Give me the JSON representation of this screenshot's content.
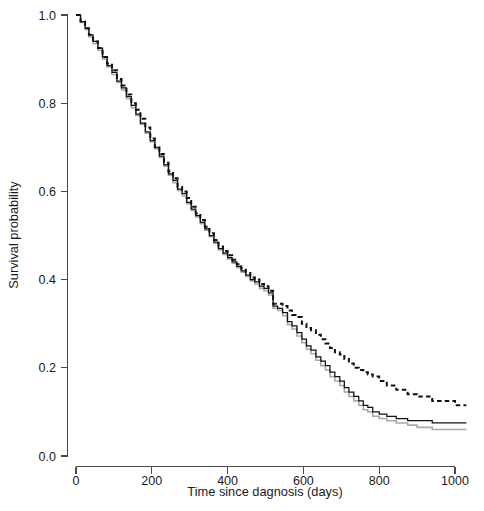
{
  "figure": {
    "name": "kaplan-meier-survival-plot",
    "background": "#ffffff"
  },
  "chart_data": {
    "type": "line",
    "title": "",
    "subtitle": "",
    "xlabel": "Time since dagnosis (days)",
    "ylabel": "Survival probability",
    "xlim": [
      0,
      1040
    ],
    "ylim": [
      0.0,
      1.0
    ],
    "grid": false,
    "legend": null,
    "legend_position": "none",
    "xticks": [
      0,
      200,
      400,
      600,
      800,
      1000
    ],
    "xticklabels": [
      "0",
      "200",
      "400",
      "600",
      "800",
      "1000"
    ],
    "yticks": [
      0.0,
      0.2,
      0.4,
      0.6,
      0.8,
      1.0
    ],
    "yticklabels": [
      "0.0",
      "0.2",
      "0.4",
      "0.6",
      "0.8",
      "1.0"
    ],
    "step_shape": "hv",
    "series": [
      {
        "name": "curve-dashed",
        "style": "dashed",
        "color": "#111111",
        "width": 2.0,
        "final_value": 0.115,
        "x": [
          0,
          12,
          24,
          34,
          45,
          58,
          70,
          82,
          95,
          108,
          120,
          133,
          146,
          158,
          170,
          183,
          196,
          208,
          220,
          232,
          244,
          256,
          268,
          280,
          292,
          304,
          316,
          328,
          340,
          352,
          364,
          376,
          388,
          400,
          412,
          424,
          436,
          448,
          460,
          472,
          484,
          496,
          508,
          520,
          532,
          545,
          558,
          570,
          583,
          596,
          608,
          620,
          633,
          646,
          658,
          670,
          683,
          696,
          708,
          720,
          733,
          746,
          758,
          770,
          783,
          800,
          820,
          845,
          875,
          900,
          940,
          1000,
          1030
        ],
        "y": [
          1.0,
          0.985,
          0.97,
          0.955,
          0.94,
          0.925,
          0.905,
          0.89,
          0.875,
          0.855,
          0.84,
          0.82,
          0.8,
          0.785,
          0.765,
          0.745,
          0.72,
          0.7,
          0.685,
          0.665,
          0.645,
          0.63,
          0.61,
          0.6,
          0.585,
          0.565,
          0.55,
          0.535,
          0.52,
          0.505,
          0.49,
          0.475,
          0.465,
          0.455,
          0.445,
          0.435,
          0.425,
          0.415,
          0.405,
          0.4,
          0.39,
          0.385,
          0.375,
          0.345,
          0.345,
          0.34,
          0.33,
          0.32,
          0.315,
          0.3,
          0.29,
          0.285,
          0.275,
          0.265,
          0.255,
          0.245,
          0.235,
          0.23,
          0.22,
          0.21,
          0.2,
          0.195,
          0.19,
          0.185,
          0.18,
          0.17,
          0.16,
          0.15,
          0.14,
          0.135,
          0.125,
          0.115,
          0.115
        ]
      },
      {
        "name": "curve-solid-dark",
        "style": "solid",
        "color": "#111111",
        "width": 1.25,
        "final_value": 0.075,
        "x": [
          0,
          12,
          24,
          34,
          45,
          58,
          70,
          82,
          95,
          108,
          120,
          133,
          146,
          158,
          170,
          183,
          196,
          208,
          220,
          232,
          244,
          256,
          268,
          280,
          292,
          304,
          316,
          328,
          340,
          352,
          364,
          376,
          388,
          400,
          412,
          424,
          436,
          448,
          460,
          472,
          484,
          496,
          508,
          520,
          532,
          545,
          558,
          570,
          583,
          596,
          608,
          620,
          633,
          646,
          658,
          670,
          683,
          696,
          708,
          720,
          733,
          746,
          758,
          770,
          783,
          800,
          820,
          845,
          875,
          900,
          940,
          1000,
          1030
        ],
        "y": [
          1.0,
          0.985,
          0.97,
          0.955,
          0.94,
          0.925,
          0.905,
          0.885,
          0.87,
          0.85,
          0.835,
          0.815,
          0.795,
          0.775,
          0.755,
          0.735,
          0.715,
          0.7,
          0.68,
          0.66,
          0.64,
          0.625,
          0.605,
          0.595,
          0.575,
          0.56,
          0.545,
          0.53,
          0.515,
          0.5,
          0.485,
          0.47,
          0.46,
          0.45,
          0.44,
          0.43,
          0.42,
          0.41,
          0.4,
          0.395,
          0.385,
          0.38,
          0.37,
          0.34,
          0.335,
          0.325,
          0.305,
          0.295,
          0.28,
          0.265,
          0.25,
          0.24,
          0.225,
          0.215,
          0.205,
          0.19,
          0.18,
          0.17,
          0.155,
          0.145,
          0.135,
          0.125,
          0.115,
          0.11,
          0.1,
          0.095,
          0.09,
          0.085,
          0.08,
          0.08,
          0.075,
          0.075,
          0.075
        ]
      },
      {
        "name": "curve-solid-gray",
        "style": "solid",
        "color": "#a9a9a9",
        "width": 1.6,
        "final_value": 0.06,
        "x": [
          0,
          12,
          24,
          34,
          45,
          58,
          70,
          82,
          95,
          108,
          120,
          133,
          146,
          158,
          170,
          183,
          196,
          208,
          220,
          232,
          244,
          256,
          268,
          280,
          292,
          304,
          316,
          328,
          340,
          352,
          364,
          376,
          388,
          400,
          412,
          424,
          436,
          448,
          460,
          472,
          484,
          496,
          508,
          520,
          532,
          545,
          558,
          570,
          583,
          596,
          608,
          620,
          633,
          646,
          658,
          670,
          683,
          696,
          708,
          720,
          733,
          746,
          758,
          770,
          783,
          800,
          820,
          845,
          875,
          900,
          940,
          1000,
          1030
        ],
        "y": [
          1.0,
          0.983,
          0.967,
          0.95,
          0.935,
          0.92,
          0.9,
          0.882,
          0.865,
          0.847,
          0.83,
          0.81,
          0.79,
          0.772,
          0.752,
          0.732,
          0.712,
          0.697,
          0.677,
          0.657,
          0.637,
          0.62,
          0.602,
          0.59,
          0.572,
          0.557,
          0.542,
          0.527,
          0.512,
          0.497,
          0.482,
          0.467,
          0.457,
          0.447,
          0.437,
          0.427,
          0.417,
          0.407,
          0.397,
          0.39,
          0.38,
          0.375,
          0.365,
          0.335,
          0.33,
          0.318,
          0.298,
          0.288,
          0.272,
          0.257,
          0.242,
          0.232,
          0.217,
          0.205,
          0.195,
          0.18,
          0.17,
          0.16,
          0.145,
          0.135,
          0.125,
          0.115,
          0.105,
          0.1,
          0.09,
          0.085,
          0.08,
          0.075,
          0.07,
          0.065,
          0.06,
          0.06,
          0.06
        ]
      }
    ]
  }
}
